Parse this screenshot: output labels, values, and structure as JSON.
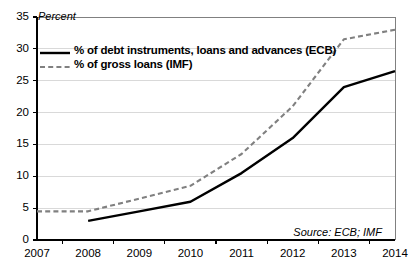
{
  "chart_data": {
    "type": "line",
    "title": "",
    "xlabel": "",
    "ylabel": "Percent",
    "ylim": [
      0,
      35
    ],
    "ytick_step": 5,
    "yticks": [
      "0",
      "5",
      "10",
      "15",
      "20",
      "25",
      "30",
      "35"
    ],
    "categories": [
      "2007",
      "2008",
      "2009",
      "2010",
      "2011",
      "2012",
      "2013",
      "2014"
    ],
    "x": [
      2007,
      2008,
      2009,
      2010,
      2011,
      2012,
      2013,
      2014
    ],
    "grid": true,
    "legend_position": "top-left",
    "annotation": "Source: ECB; IMF",
    "series": [
      {
        "name": "% of debt instruments, loans and advances (ECB)",
        "style": "solid",
        "color": "#000000",
        "x": [
          2008,
          2009,
          2010,
          2011,
          2012,
          2013,
          2014
        ],
        "values": [
          3.0,
          4.5,
          6.0,
          10.5,
          16.0,
          24.0,
          26.5
        ]
      },
      {
        "name": "% of gross loans (IMF)",
        "style": "dashed",
        "color": "#808080",
        "x": [
          2007,
          2008,
          2009,
          2010,
          2011,
          2012,
          2013,
          2014
        ],
        "values": [
          4.5,
          4.5,
          6.5,
          8.5,
          13.5,
          21.0,
          31.5,
          33.0
        ]
      }
    ]
  },
  "legend": {
    "items": [
      {
        "label": "% of debt instruments, loans and advances (ECB)",
        "style": "solid"
      },
      {
        "label": "% of gross loans (IMF)",
        "style": "dashed"
      }
    ]
  },
  "colors": {
    "series_ecb": "#000000",
    "series_imf": "#808080",
    "grid": "#d9d9d9",
    "frame": "#808080",
    "axis": "#000000",
    "background": "#ffffff"
  }
}
